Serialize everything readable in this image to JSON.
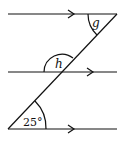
{
  "diagram": {
    "type": "parallel-lines-transversal",
    "lines": [
      {
        "name": "top",
        "y": 14,
        "x1": 8,
        "x2": 117,
        "arrow_x": 72
      },
      {
        "name": "middle",
        "y": 72,
        "x1": 8,
        "x2": 117,
        "arrow_x": 92
      },
      {
        "name": "bottom",
        "y": 129,
        "x1": 8,
        "x2": 117,
        "arrow_x": 72
      }
    ],
    "transversal": {
      "x1": 117,
      "y1": 14,
      "x2": 8,
      "y2": 129
    },
    "labels": {
      "g": "g",
      "h": "h",
      "given_angle": "25°"
    },
    "color": "#111111"
  }
}
